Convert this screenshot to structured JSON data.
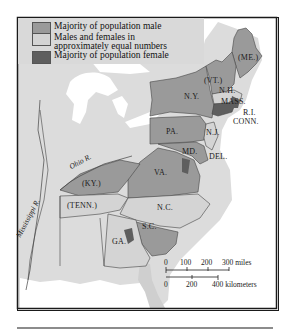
{
  "legend": {
    "items": [
      {
        "label": "Majority of population male",
        "color": "#9a9a9a"
      },
      {
        "label_line1": "Males and females in",
        "label_line2": "approximately equal numbers",
        "color": "#d4d4d4"
      },
      {
        "label": "Majority of population female",
        "color": "#5e5e5e"
      }
    ]
  },
  "states": {
    "me": "(ME.)",
    "vt": "(VT.)",
    "nh": "N.H.",
    "mass": "MASS.",
    "ri": "R.I.",
    "conn": "CONN.",
    "ny": "N.Y.",
    "nj": "N.J.",
    "pa": "PA.",
    "md": "MD.",
    "del": "DEL.",
    "va": "VA.",
    "ky": "(KY.)",
    "tenn": "(TENN.)",
    "nc": "N.C.",
    "sc": "S.C.",
    "ga": "GA."
  },
  "rivers": {
    "ohio": "Ohio R.",
    "mississippi": "Mississippi R."
  },
  "scale": {
    "miles_ticks": [
      "0",
      "100",
      "200",
      "300 miles"
    ],
    "km_ticks": [
      "0",
      "200",
      "400 kilometers"
    ]
  },
  "colors": {
    "male": "#9a9a9a",
    "equal": "#d4d4d4",
    "female": "#5e5e5e",
    "land_other": "#dcdcdc",
    "water": "#ffffff"
  }
}
